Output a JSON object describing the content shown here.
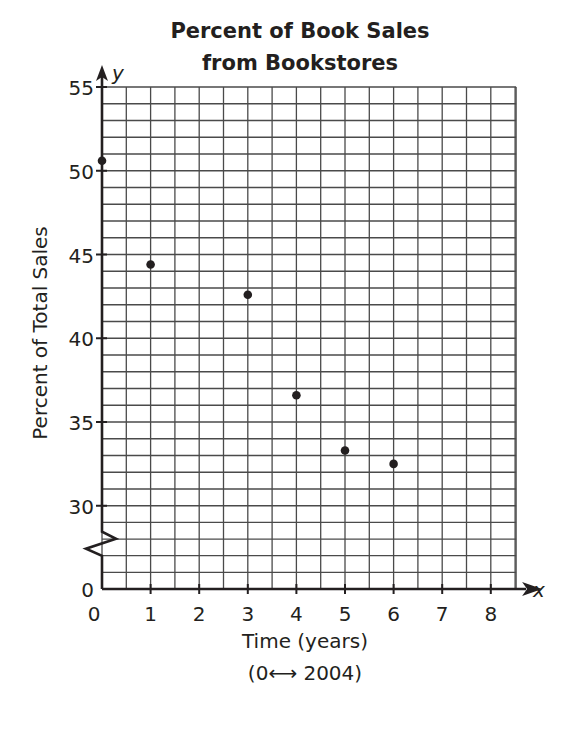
{
  "chart_data": {
    "type": "scatter",
    "title": "Percent of Book Sales from Bookstores",
    "title_lines": [
      "Percent of Book Sales",
      "from Bookstores"
    ],
    "xlabel": "Time (years)",
    "xlabel_note": "(0⟷ 2004)",
    "ylabel": "Percent of Total Sales",
    "x_axis_var": "x",
    "y_axis_var": "y",
    "xlim": [
      0,
      8.5
    ],
    "ylim": [
      0,
      55
    ],
    "y_axis_break": [
      0,
      30
    ],
    "x_ticks": [
      0,
      1,
      2,
      3,
      4,
      5,
      6,
      7,
      8
    ],
    "y_ticks": [
      0,
      30,
      35,
      40,
      45,
      50,
      55
    ],
    "grid": true,
    "x_minor_step": 0.5,
    "y_minor_step": 1,
    "series": [
      {
        "name": "Bookstore sales share",
        "points": [
          {
            "x": 0,
            "y": 50.6
          },
          {
            "x": 1,
            "y": 44.4
          },
          {
            "x": 3,
            "y": 42.6
          },
          {
            "x": 4,
            "y": 36.6
          },
          {
            "x": 5,
            "y": 33.3
          },
          {
            "x": 6,
            "y": 32.5
          }
        ]
      }
    ]
  },
  "colors": {
    "ink": "#231f20",
    "grid": "#4a4a4a",
    "background": "#ffffff"
  }
}
